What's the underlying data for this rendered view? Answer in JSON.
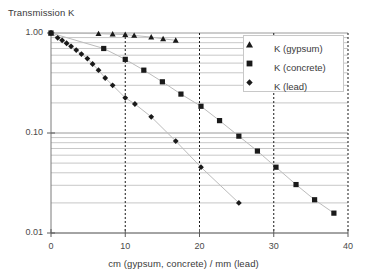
{
  "chart_data": {
    "type": "scatter",
    "title": "Transmission K",
    "xlabel": "cm (gypsum, concrete) / mm (lead)",
    "ylabel": "Transmission K",
    "yscale": "log",
    "xlim": [
      0,
      40
    ],
    "ylim": [
      0.01,
      1.0
    ],
    "grid": true,
    "xticks": [
      "0",
      "10",
      "20",
      "30",
      "40"
    ],
    "xtick_values": [
      0,
      10,
      20,
      30,
      40
    ],
    "yticks": [
      "1.00",
      "0.10",
      "0.01"
    ],
    "ytick_values": [
      1.0,
      0.1,
      0.01
    ],
    "legend_position": "top-right",
    "series": [
      {
        "name": "K (gypsum)",
        "marker": "triangle",
        "color": "#1a1a1a",
        "points": [
          {
            "x": 0.0,
            "y": 1.0
          },
          {
            "x": 6.4,
            "y": 0.985
          },
          {
            "x": 8.3,
            "y": 0.975
          },
          {
            "x": 10.0,
            "y": 0.965
          },
          {
            "x": 11.2,
            "y": 0.945
          },
          {
            "x": 13.5,
            "y": 0.91
          },
          {
            "x": 15.1,
            "y": 0.875
          },
          {
            "x": 16.8,
            "y": 0.845
          }
        ]
      },
      {
        "name": "K (concrete)",
        "marker": "square",
        "color": "#1a1a1a",
        "points": [
          {
            "x": 0.0,
            "y": 1.0
          },
          {
            "x": 7.1,
            "y": 0.7
          },
          {
            "x": 10.0,
            "y": 0.545
          },
          {
            "x": 12.5,
            "y": 0.425
          },
          {
            "x": 15.0,
            "y": 0.325
          },
          {
            "x": 17.5,
            "y": 0.245
          },
          {
            "x": 20.2,
            "y": 0.185
          },
          {
            "x": 22.7,
            "y": 0.133
          },
          {
            "x": 25.3,
            "y": 0.093
          },
          {
            "x": 27.8,
            "y": 0.066
          },
          {
            "x": 30.3,
            "y": 0.0455
          },
          {
            "x": 33.0,
            "y": 0.0305
          },
          {
            "x": 35.5,
            "y": 0.0215
          },
          {
            "x": 38.1,
            "y": 0.0158
          }
        ]
      },
      {
        "name": "K (lead)",
        "marker": "diamond",
        "color": "#1a1a1a",
        "points": [
          {
            "x": 0.0,
            "y": 1.0
          },
          {
            "x": 0.9,
            "y": 0.895
          },
          {
            "x": 1.5,
            "y": 0.845
          },
          {
            "x": 2.1,
            "y": 0.79
          },
          {
            "x": 2.7,
            "y": 0.735
          },
          {
            "x": 3.4,
            "y": 0.675
          },
          {
            "x": 4.1,
            "y": 0.615
          },
          {
            "x": 4.9,
            "y": 0.555
          },
          {
            "x": 5.6,
            "y": 0.49
          },
          {
            "x": 6.4,
            "y": 0.425
          },
          {
            "x": 7.3,
            "y": 0.355
          },
          {
            "x": 8.3,
            "y": 0.3
          },
          {
            "x": 10.0,
            "y": 0.225
          },
          {
            "x": 11.3,
            "y": 0.195
          },
          {
            "x": 13.5,
            "y": 0.145
          },
          {
            "x": 16.8,
            "y": 0.083
          },
          {
            "x": 20.2,
            "y": 0.0455
          },
          {
            "x": 25.3,
            "y": 0.02
          }
        ]
      }
    ]
  },
  "legend": {
    "items": [
      {
        "label": "K (gypsum)",
        "marker": "triangle"
      },
      {
        "label": "K (concrete)",
        "marker": "square"
      },
      {
        "label": "K (lead)",
        "marker": "diamond"
      }
    ]
  }
}
